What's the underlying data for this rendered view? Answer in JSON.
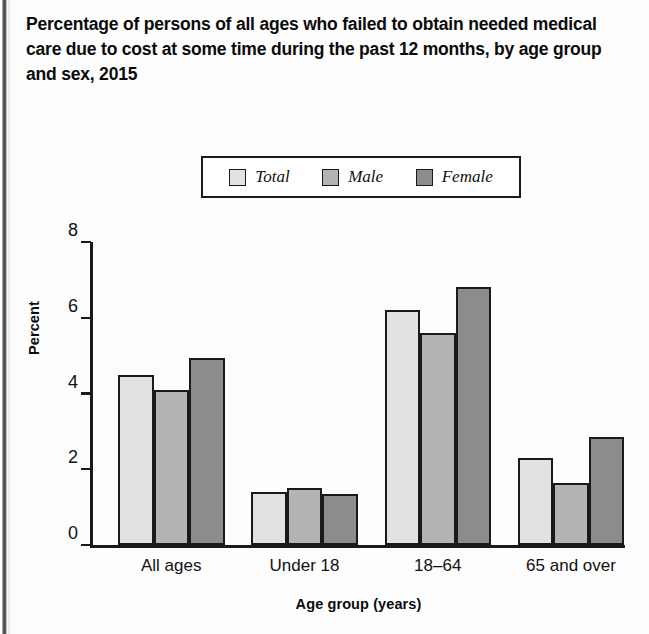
{
  "figure": {
    "title": "Percentage of persons of all ages who failed to obtain needed medical care due to cost at some time during the past 12 months, by age group and sex, 2015"
  },
  "legend": {
    "items": [
      {
        "label": "Total",
        "color": "#e2e2e2"
      },
      {
        "label": "Male",
        "color": "#b4b4b4"
      },
      {
        "label": "Female",
        "color": "#8c8c8c"
      }
    ]
  },
  "axes": {
    "y_title": "Percent",
    "x_title": "Age group (years)",
    "y_ticks": [
      "8",
      "6",
      "4",
      "2",
      "0"
    ]
  },
  "chart_data": {
    "type": "bar",
    "title": "Percentage of persons of all ages who failed to obtain needed medical care due to cost at some time during the past 12 months, by age group and sex, 2015",
    "xlabel": "Age group (years)",
    "ylabel": "Percent",
    "ylim": [
      0,
      8
    ],
    "yticks": [
      0,
      2,
      4,
      6,
      8
    ],
    "grid": false,
    "legend_position": "top-center",
    "categories": [
      "All ages",
      "Under 18",
      "18–64",
      "65 and over"
    ],
    "series": [
      {
        "name": "Total",
        "color": "#e2e2e2",
        "values": [
          4.5,
          1.4,
          6.2,
          2.3
        ]
      },
      {
        "name": "Male",
        "color": "#b4b4b4",
        "values": [
          4.1,
          1.5,
          5.6,
          1.65
        ]
      },
      {
        "name": "Female",
        "color": "#8c8c8c",
        "values": [
          4.95,
          1.35,
          6.8,
          2.85
        ]
      }
    ]
  }
}
